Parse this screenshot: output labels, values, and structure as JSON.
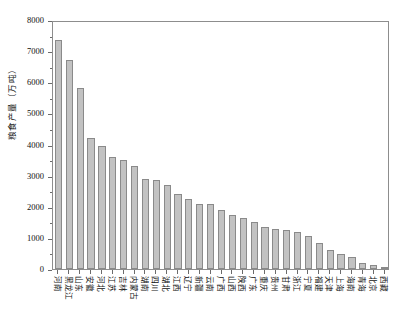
{
  "chart_data": {
    "type": "bar",
    "title": "",
    "xlabel": "",
    "ylabel": "粮食产量（万吨）",
    "ylim": [
      0,
      8000
    ],
    "yticks": [
      0,
      1000,
      2000,
      3000,
      4000,
      5000,
      6000,
      7000,
      8000
    ],
    "ytick_labels": [
      "0",
      "1000",
      "2000",
      "3000",
      "4000",
      "5000",
      "6000",
      "7000",
      "8000"
    ],
    "grid": false,
    "legend": null,
    "bar_color": "#c2c2c2",
    "bar_edge_color": "#8a8a8a",
    "categories": [
      "河南",
      "黑龙江",
      "山东",
      "安徽",
      "河北",
      "江苏",
      "吉林",
      "内蒙古",
      "湖南",
      "四川",
      "湖北",
      "江西",
      "辽宁",
      "新疆",
      "云南",
      "广西",
      "山西",
      "陕西",
      "广东",
      "重庆",
      "贵州",
      "甘肃",
      "浙江",
      "宁夏",
      "福建",
      "天津",
      "上海",
      "海南",
      "青海",
      "北京",
      "西藏"
    ],
    "values": [
      7350,
      6700,
      5800,
      4200,
      3950,
      3600,
      3500,
      3300,
      2900,
      2850,
      2700,
      2400,
      2250,
      2100,
      2080,
      1900,
      1750,
      1650,
      1500,
      1350,
      1300,
      1250,
      1180,
      1050,
      830,
      600,
      480,
      400,
      200,
      140,
      70
    ]
  }
}
